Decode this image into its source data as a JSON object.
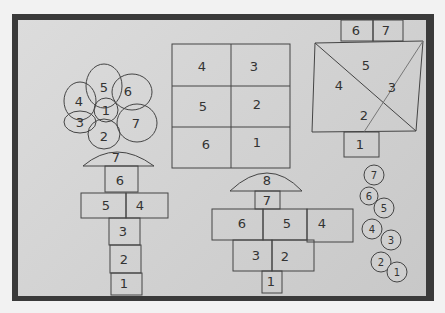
{
  "photo": {
    "description": "Hopscotch drawings on paper board",
    "flower_hopscotch": {
      "petals": [
        "5",
        "6",
        "7",
        "2",
        "3",
        "4"
      ],
      "center": "1",
      "stem_top": "7",
      "cells": [
        "6",
        "5",
        "4",
        "3",
        "2",
        "1"
      ]
    },
    "grid_hopscotch": {
      "rows": [
        [
          "4",
          "3"
        ],
        [
          "5",
          "2"
        ],
        [
          "6",
          "1"
        ]
      ]
    },
    "triangle_hopscotch": {
      "top": [
        "6",
        "7"
      ],
      "triangles": [
        "5",
        "4",
        "3",
        "2"
      ],
      "bottom": "1"
    },
    "mushroom_hopscotch": {
      "cap": "8",
      "stem": "7",
      "row3": [
        "6",
        "5",
        "4"
      ],
      "row2": [
        "3",
        "2"
      ],
      "bottom": "1"
    },
    "circle_chain": [
      "7",
      "6",
      "5",
      "4",
      "3",
      "2",
      "1"
    ]
  }
}
